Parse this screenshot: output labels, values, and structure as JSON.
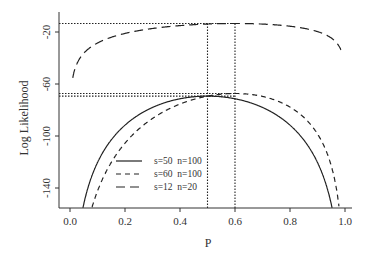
{
  "chart_data": {
    "type": "line",
    "title": "",
    "xlabel": "P",
    "ylabel": "Log Likelihood",
    "xlim": [
      -0.04,
      1.02
    ],
    "ylim": [
      -155,
      -10
    ],
    "xticks": [
      "0.0",
      "0.2",
      "0.4",
      "0.6",
      "0.8",
      "1.0"
    ],
    "yticks": [
      "-20",
      "-60",
      "-100",
      "-140"
    ],
    "grid": false,
    "legend_position": "lower-left-inside",
    "series": [
      {
        "name": "s=50  n=100",
        "s": 50,
        "n": 100,
        "style": "solid",
        "max_p": 0.5,
        "max_value": -69.3
      },
      {
        "name": "s=60  n=100",
        "s": 60,
        "n": 100,
        "style": "short-dash",
        "max_p": 0.6,
        "max_value": -67.3
      },
      {
        "name": "s=12  n=20",
        "s": 12,
        "n": 20,
        "style": "long-dash",
        "max_p": 0.6,
        "max_value": -13.5
      }
    ],
    "reference_lines": [
      {
        "type": "horizontal",
        "y": -13.5,
        "style": "dotted"
      },
      {
        "type": "horizontal",
        "y": -67.3,
        "style": "dotted"
      },
      {
        "type": "horizontal",
        "y": -69.3,
        "style": "dotted"
      },
      {
        "type": "vertical",
        "x": 0.5,
        "style": "dotted"
      },
      {
        "type": "vertical",
        "x": 0.6,
        "style": "dotted"
      }
    ]
  },
  "labels": {
    "xlabel": "P",
    "ylabel": "Log Likelihood",
    "legend": [
      "s=50  n=100",
      "s=60  n=100",
      "s=12  n=20"
    ],
    "yticks": [
      "-20",
      "-60",
      "-100",
      "-140"
    ],
    "xticks": [
      "0.0",
      "0.2",
      "0.4",
      "0.6",
      "0.8",
      "1.0"
    ]
  }
}
